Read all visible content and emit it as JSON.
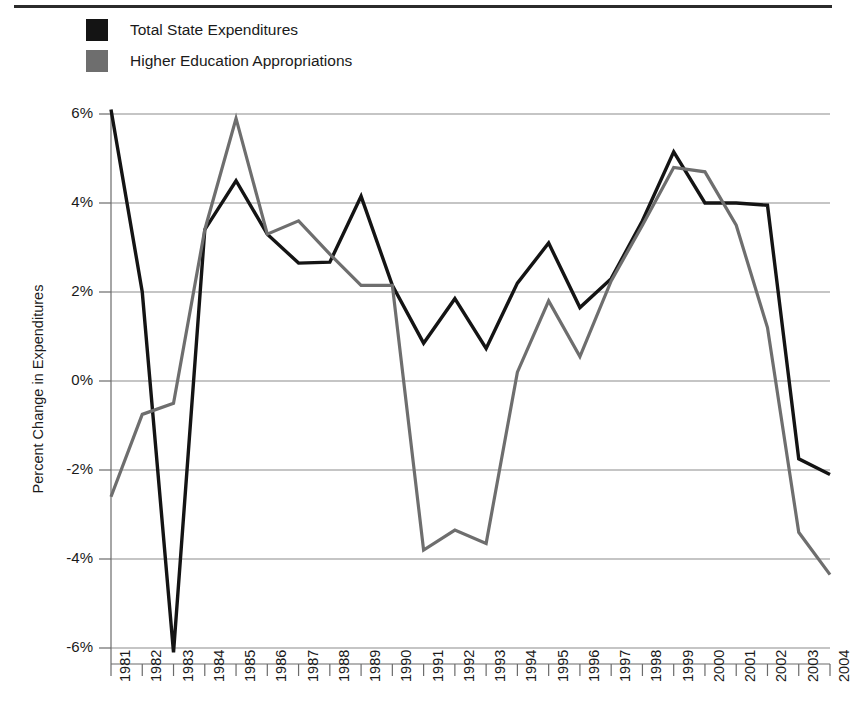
{
  "legend": {
    "position": "top-left",
    "items": [
      {
        "label": "Total State Expenditures",
        "color": "#141414",
        "key": "total_state_expenditures"
      },
      {
        "label": "Higher Education Appropriations",
        "color": "#6e6e6e",
        "key": "higher_education_appropriations"
      }
    ]
  },
  "axes": {
    "ylabel": "Percent Change in Expenditures",
    "xlabel": "",
    "ytick_labels": [
      "6%",
      "4%",
      "2%",
      "0%",
      "-2%",
      "-4%",
      "-6%"
    ],
    "ytick_values": [
      6,
      4,
      2,
      0,
      -2,
      -4,
      -6
    ]
  },
  "chart_data": {
    "type": "line",
    "title": "",
    "xlabel": "",
    "ylabel": "Percent Change in Expenditures",
    "ylim": [
      -6,
      6
    ],
    "grid": true,
    "legend_position": "top-left",
    "categories": [
      "1981",
      "1982",
      "1983",
      "1984",
      "1985",
      "1986",
      "1987",
      "1988",
      "1989",
      "1990",
      "1991",
      "1992",
      "1993",
      "1994",
      "1995",
      "1996",
      "1997",
      "1998",
      "1999",
      "2000",
      "2001",
      "2002",
      "2003",
      "2004"
    ],
    "series": [
      {
        "name": "Total State Expenditures",
        "color": "#141414",
        "values": [
          6.1,
          2.0,
          -6.1,
          3.4,
          4.5,
          3.3,
          2.65,
          2.67,
          4.15,
          2.15,
          0.85,
          1.85,
          0.73,
          2.2,
          3.1,
          1.65,
          2.3,
          3.6,
          5.15,
          4.0,
          4.0,
          3.95,
          -1.75,
          -2.1
        ]
      },
      {
        "name": "Higher Education Appropriations",
        "color": "#6e6e6e",
        "values": [
          -2.6,
          -0.75,
          -0.5,
          3.4,
          5.9,
          3.3,
          3.6,
          2.85,
          2.15,
          2.15,
          -3.8,
          -3.35,
          -3.65,
          0.2,
          1.8,
          0.55,
          2.25,
          3.5,
          4.8,
          4.7,
          3.5,
          1.2,
          -3.4,
          -4.35
        ]
      }
    ]
  }
}
